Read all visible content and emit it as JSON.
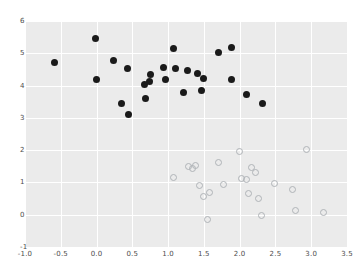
{
  "chart_data": {
    "type": "scatter",
    "title": "",
    "xlabel": "",
    "ylabel": "",
    "xlim": [
      -1.0,
      3.5
    ],
    "ylim": [
      -1,
      6
    ],
    "grid": true,
    "legend": "none",
    "xticks": [
      "-1.0",
      "-0.5",
      "0.0",
      "0.5",
      "1.0",
      "1.5",
      "2.0",
      "2.5",
      "3.0",
      "3.5"
    ],
    "xtick_values": [
      -1.0,
      -0.5,
      0.0,
      0.5,
      1.0,
      1.5,
      2.0,
      2.5,
      3.0,
      3.5
    ],
    "yticks": [
      "-1",
      "0",
      "1",
      "2",
      "3",
      "4",
      "5",
      "6"
    ],
    "ytick_values": [
      -1,
      0,
      1,
      2,
      3,
      4,
      5,
      6
    ],
    "series": [
      {
        "name": "cluster-1",
        "marker": "filled-circle",
        "color": "#1a1a1a",
        "points": [
          [
            -0.59,
            4.7
          ],
          [
            -0.01,
            5.47
          ],
          [
            0.0,
            4.18
          ],
          [
            0.24,
            4.77
          ],
          [
            0.35,
            3.44
          ],
          [
            0.43,
            4.53
          ],
          [
            0.44,
            3.11
          ],
          [
            0.67,
            4.04
          ],
          [
            0.69,
            3.6
          ],
          [
            0.74,
            4.12
          ],
          [
            0.76,
            4.33
          ],
          [
            0.93,
            4.55
          ],
          [
            0.96,
            4.18
          ],
          [
            1.07,
            5.15
          ],
          [
            1.1,
            4.52
          ],
          [
            1.21,
            3.79
          ],
          [
            1.27,
            4.48
          ],
          [
            1.41,
            4.37
          ],
          [
            1.46,
            3.86
          ],
          [
            1.49,
            4.22
          ],
          [
            1.71,
            5.02
          ],
          [
            1.88,
            5.17
          ],
          [
            1.89,
            4.18
          ],
          [
            2.09,
            3.72
          ],
          [
            2.32,
            3.43
          ]
        ]
      },
      {
        "name": "cluster-2",
        "marker": "open-circle",
        "color": "#b0b4b8",
        "points": [
          [
            1.07,
            1.16
          ],
          [
            1.29,
            1.49
          ],
          [
            1.34,
            1.44
          ],
          [
            1.38,
            1.51
          ],
          [
            1.44,
            0.92
          ],
          [
            1.5,
            0.55
          ],
          [
            1.55,
            -0.15
          ],
          [
            1.58,
            0.68
          ],
          [
            1.71,
            1.62
          ],
          [
            1.77,
            0.93
          ],
          [
            2.0,
            1.96
          ],
          [
            2.03,
            1.13
          ],
          [
            2.09,
            1.1
          ],
          [
            2.13,
            0.66
          ],
          [
            2.16,
            1.47
          ],
          [
            2.22,
            1.31
          ],
          [
            2.27,
            0.49
          ],
          [
            2.3,
            -0.03
          ],
          [
            2.49,
            0.98
          ],
          [
            2.74,
            0.79
          ],
          [
            2.78,
            0.13
          ],
          [
            2.94,
            2.03
          ],
          [
            3.17,
            0.07
          ]
        ]
      }
    ]
  }
}
